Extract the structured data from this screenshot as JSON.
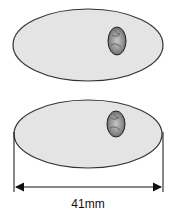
{
  "diagram": {
    "shapes": [
      {
        "name": "top-oval",
        "cx": 88,
        "cy": 45,
        "rx": 75,
        "ry": 36,
        "fill": "#e4e4e4",
        "stroke": "#333333",
        "inclusion": {
          "cx": 117,
          "cy": 41,
          "rx": 9,
          "ry": 14,
          "fill": "#9a9a9a"
        }
      },
      {
        "name": "bottom-oval",
        "cx": 88,
        "cy": 134,
        "rx": 74,
        "ry": 34,
        "fill": "#e4e4e4",
        "stroke": "#333333",
        "inclusion": {
          "cx": 116,
          "cy": 124,
          "rx": 9,
          "ry": 13,
          "fill": "#9a9a9a"
        }
      }
    ],
    "dimension": {
      "label": "41mm",
      "x1": 14,
      "x2": 163,
      "y": 187
    }
  }
}
